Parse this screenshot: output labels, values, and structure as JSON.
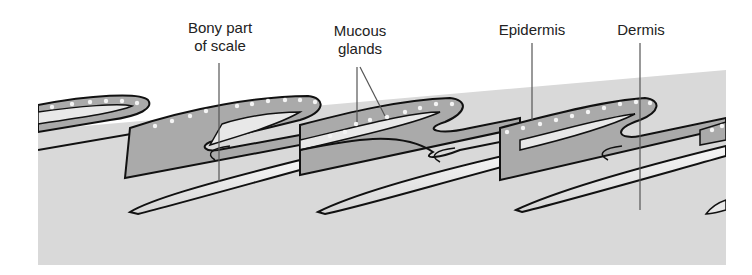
{
  "diagram": {
    "type": "cross-section illustration",
    "colors": {
      "background": "#ffffff",
      "dermis_fill": "#d8d8d8",
      "epidermis_fill": "#a9a9a9",
      "bony_scale_fill": "#ececec",
      "outline": "#111111",
      "gland_dots": "#f4f4f4",
      "leader_line": "#555555"
    },
    "labels": [
      {
        "id": "bony-part",
        "lines": [
          "Bony part",
          "of scale"
        ]
      },
      {
        "id": "mucous-glands",
        "lines": [
          "Mucous",
          "glands"
        ]
      },
      {
        "id": "epidermis",
        "lines": [
          "Epidermis"
        ]
      },
      {
        "id": "dermis",
        "lines": [
          "Dermis"
        ]
      }
    ]
  }
}
